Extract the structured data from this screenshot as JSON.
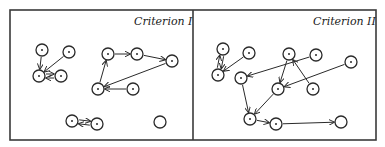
{
  "panels": [
    {
      "id": "panel-1",
      "title": "Criterion I",
      "title_pos": [
        134,
        25
      ],
      "nodes": [
        {
          "id": "a",
          "x": 42,
          "y": 50,
          "dot": true
        },
        {
          "id": "b",
          "x": 69,
          "y": 52,
          "dot": true
        },
        {
          "id": "c",
          "x": 39,
          "y": 76,
          "dot": true
        },
        {
          "id": "d",
          "x": 61,
          "y": 76,
          "dot": true
        },
        {
          "id": "e",
          "x": 108,
          "y": 54,
          "dot": true
        },
        {
          "id": "f",
          "x": 137,
          "y": 54,
          "dot": true
        },
        {
          "id": "g",
          "x": 172,
          "y": 61,
          "dot": true
        },
        {
          "id": "h",
          "x": 98,
          "y": 89,
          "dot": true
        },
        {
          "id": "i",
          "x": 133,
          "y": 89,
          "dot": true
        },
        {
          "id": "j",
          "x": 72,
          "y": 121,
          "dot": true
        },
        {
          "id": "k",
          "x": 97,
          "y": 124,
          "dot": true
        },
        {
          "id": "l",
          "x": 160,
          "y": 122,
          "dot": false
        }
      ],
      "edges": [
        {
          "from": "a",
          "to": "c"
        },
        {
          "from": "b",
          "to": "c"
        },
        {
          "from": "c",
          "to": "d",
          "offset": -2
        },
        {
          "from": "d",
          "to": "c",
          "offset": -2
        },
        {
          "from": "e",
          "to": "f"
        },
        {
          "from": "f",
          "to": "g"
        },
        {
          "from": "g",
          "to": "h"
        },
        {
          "from": "i",
          "to": "h"
        },
        {
          "from": "h",
          "to": "e"
        },
        {
          "from": "j",
          "to": "k",
          "offset": -2
        },
        {
          "from": "k",
          "to": "j",
          "offset": -2
        }
      ]
    },
    {
      "id": "panel-2",
      "title": "Criterion II",
      "title_pos": [
        313,
        25
      ],
      "nodes": [
        {
          "id": "a",
          "x": 223,
          "y": 49,
          "dot": true
        },
        {
          "id": "b",
          "x": 249,
          "y": 53,
          "dot": true
        },
        {
          "id": "c",
          "x": 218,
          "y": 75,
          "dot": true
        },
        {
          "id": "d",
          "x": 241,
          "y": 78,
          "dot": true
        },
        {
          "id": "e",
          "x": 289,
          "y": 54,
          "dot": true
        },
        {
          "id": "f",
          "x": 316,
          "y": 55,
          "dot": true
        },
        {
          "id": "g",
          "x": 351,
          "y": 62,
          "dot": true
        },
        {
          "id": "h",
          "x": 278,
          "y": 89,
          "dot": true
        },
        {
          "id": "i",
          "x": 313,
          "y": 89,
          "dot": true
        },
        {
          "id": "j",
          "x": 250,
          "y": 119,
          "dot": true
        },
        {
          "id": "k",
          "x": 276,
          "y": 124,
          "dot": true
        },
        {
          "id": "l",
          "x": 341,
          "y": 122,
          "dot": false
        }
      ],
      "edges": [
        {
          "from": "b",
          "to": "c"
        },
        {
          "from": "a",
          "to": "c",
          "offset": -2
        },
        {
          "from": "c",
          "to": "a",
          "offset": -2
        },
        {
          "from": "f",
          "to": "d"
        },
        {
          "from": "e",
          "to": "h"
        },
        {
          "from": "i",
          "to": "e"
        },
        {
          "from": "g",
          "to": "h"
        },
        {
          "from": "d",
          "to": "j"
        },
        {
          "from": "h",
          "to": "j"
        },
        {
          "from": "j",
          "to": "k"
        },
        {
          "from": "k",
          "to": "l"
        }
      ]
    }
  ],
  "frame": {
    "x": 10,
    "y": 10,
    "w": 366,
    "h": 130,
    "divider_x": 193
  },
  "node_radius": 6,
  "colors": {
    "ink": "#2a2a2a",
    "background": "#ffffff"
  }
}
